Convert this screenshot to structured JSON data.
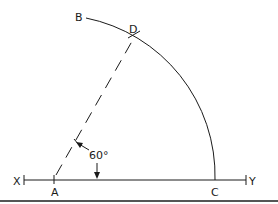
{
  "diagram": {
    "title": "",
    "labels": {
      "X": "X",
      "Y": "Y",
      "A": "A",
      "B": "B",
      "C": "C",
      "D": "D",
      "angle": "60°"
    },
    "colors": {
      "stroke": "#1a1a1a",
      "background": "#ffffff",
      "bottom_rule": "#555555"
    }
  }
}
